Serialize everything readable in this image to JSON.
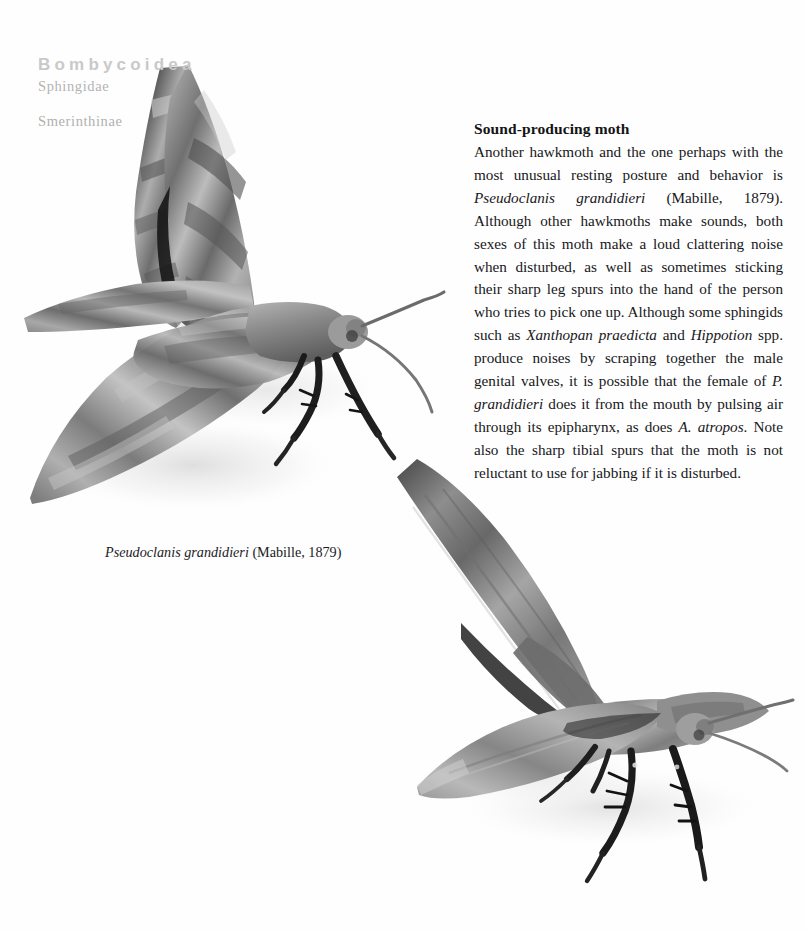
{
  "page": {
    "background_color": "#fefefe",
    "width": 805,
    "height": 931
  },
  "taxonomy": {
    "superfamily": "Bombycoidea",
    "family": "Sphingidae",
    "subfamily": "Smerinthinae",
    "superfamily_color": "#c9c9c9",
    "family_color": "#b3b3b3",
    "subfamily_color": "#b0b0b0"
  },
  "article": {
    "heading": "Sound-producing moth",
    "body_html": "Another hawkmoth and the one perhaps with the most unusual resting posture and behavior is <i>Pseudoclanis grandidieri</i> (Mabille, 1879). Although other hawkmoths make sounds, both sexes of this moth make a loud clattering noise when disturbed, as well as sometimes sticking their sharp leg spurs into the hand of the person who tries to pick one up. Although some sphingids such as <i>Xanthopan praedicta</i> and <i>Hippotion</i> spp. produce noises by scraping together the male genital valves, it is possible that the female of <i>P. grandidieri</i> does it from the mouth by pulsing air through its epipharynx, as does <i>A. atropos</i>. Note also the sharp tibial spurs that the moth is not reluctant to use for jabbing if it is disturbed.",
    "text_color": "#17171a"
  },
  "figure": {
    "caption_html": "<i>Pseudoclanis grandidieri</i> (Mabille, 1879)",
    "caption_color": "#1b1b1e",
    "specimens": [
      {
        "id": "specimen-top",
        "label": "Pseudoclanis grandidieri dorsolateral view, wings raised",
        "description": "Grayscale photograph of a hawkmoth specimen with forewings held upright and hindwings spread laterally, antennae extended to the right"
      },
      {
        "id": "specimen-bottom",
        "label": "Pseudoclanis grandidieri lateral view, resting posture",
        "description": "Grayscale photograph of the same hawkmoth species in its unusual raised resting posture showing sharp tibial leg spurs"
      }
    ]
  }
}
